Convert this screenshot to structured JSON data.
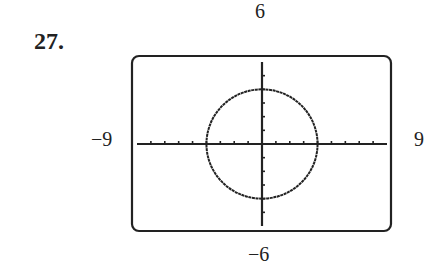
{
  "problem": {
    "number": "27."
  },
  "window": {
    "xmin_label": "−9",
    "xmax_label": "9",
    "ymin_label": "−6",
    "ymax_label": "6"
  },
  "chart_data": {
    "type": "line",
    "title": "",
    "xlabel": "",
    "ylabel": "",
    "xlim": [
      -9,
      9
    ],
    "ylim": [
      -6,
      6
    ],
    "xscale_ticks": 1,
    "yscale_ticks": 1,
    "grid": false,
    "series": [
      {
        "name": "circle",
        "equation": "x^2 + y^2 = 16",
        "center": [
          0,
          0
        ],
        "radius": 4,
        "x": [
          4,
          2.83,
          0,
          -2.83,
          -4,
          -2.83,
          0,
          2.83,
          4
        ],
        "y": [
          0,
          2.83,
          4,
          2.83,
          0,
          -2.83,
          -4,
          -2.83,
          0
        ]
      }
    ]
  }
}
